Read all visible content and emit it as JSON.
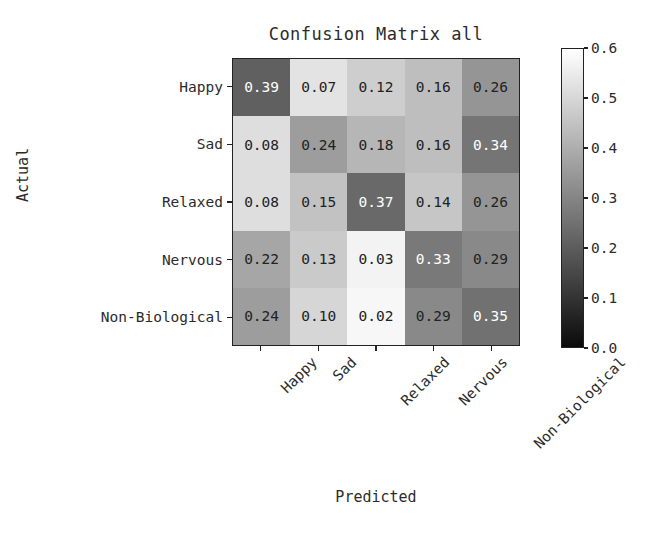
{
  "chart_data": {
    "type": "heatmap",
    "title": "Confusion Matrix all",
    "xlabel": "Predicted",
    "ylabel": "Actual",
    "x_categories": [
      "Happy",
      "Sad",
      "Relaxed",
      "Nervous",
      "Non-Biological"
    ],
    "y_categories": [
      "Happy",
      "Sad",
      "Relaxed",
      "Nervous",
      "Non-Biological"
    ],
    "values": [
      [
        0.39,
        0.07,
        0.12,
        0.16,
        0.26
      ],
      [
        0.08,
        0.24,
        0.18,
        0.16,
        0.34
      ],
      [
        0.08,
        0.15,
        0.37,
        0.14,
        0.26
      ],
      [
        0.22,
        0.13,
        0.03,
        0.33,
        0.29
      ],
      [
        0.24,
        0.1,
        0.02,
        0.29,
        0.35
      ]
    ],
    "cell_text": [
      [
        "0.39",
        "0.07",
        "0.12",
        "0.16",
        "0.26"
      ],
      [
        "0.08",
        "0.24",
        "0.18",
        "0.16",
        "0.34"
      ],
      [
        "0.08",
        "0.15",
        "0.37",
        "0.14",
        "0.26"
      ],
      [
        "0.22",
        "0.13",
        "0.03",
        "0.33",
        "0.29"
      ],
      [
        "0.24",
        "0.10",
        "0.02",
        "0.29",
        "0.35"
      ]
    ],
    "colormap": "Greys",
    "colorbar": {
      "vmin": 0.0,
      "vmax": 0.6,
      "ticks": [
        0.0,
        0.1,
        0.2,
        0.3,
        0.4,
        0.5,
        0.6
      ],
      "tick_labels": [
        "0.0",
        "0.1",
        "0.2",
        "0.3",
        "0.4",
        "0.5",
        "0.6"
      ],
      "low_color": "#ffffff",
      "high_color": "#000000",
      "position": "right"
    },
    "text_color_threshold": 0.3,
    "light_text_color": "#ffffff",
    "dark_text_color": "#222222",
    "grid": false,
    "xtick_rotation": -45
  }
}
